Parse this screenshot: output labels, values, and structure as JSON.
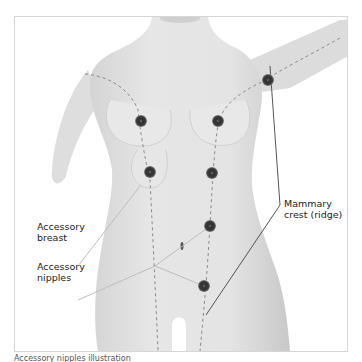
{
  "figure": {
    "labels": {
      "accessory_breast": [
        "Accessory",
        "breast"
      ],
      "accessory_nipples": [
        "Accessory",
        "nipples"
      ],
      "mammary_crest": [
        "Mammary",
        "crest (ridge)"
      ]
    },
    "caption": "Accessory nipples illustration",
    "colors": {
      "skin": "#e2e2e2",
      "skin_shadow": "#cfcfcf",
      "nipple": "#3a3a3a",
      "nipple_ring": "#6e6e6e",
      "leader_line": "#555555",
      "dashed_line": "#8a8a8a"
    },
    "nipples": [
      {
        "id": "axilla",
        "x": 268,
        "y": 80
      },
      {
        "id": "right-breast",
        "x": 141,
        "y": 121
      },
      {
        "id": "left-breast",
        "x": 218,
        "y": 121
      },
      {
        "id": "accessory-breast",
        "x": 150,
        "y": 172
      },
      {
        "id": "left-chest-lower",
        "x": 212,
        "y": 173
      },
      {
        "id": "abdomen",
        "x": 210,
        "y": 226
      },
      {
        "id": "lower-abdomen",
        "x": 204,
        "y": 286
      }
    ]
  }
}
